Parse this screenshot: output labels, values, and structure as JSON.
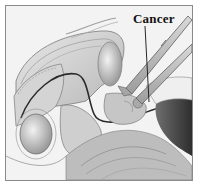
{
  "illustration": {
    "subject": "anatomical cross-section with surgical instruments",
    "style": "grayscale pencil rendering",
    "border_color": "#8a8a8a",
    "annotation": {
      "label": "Cancer",
      "pointer": "leader-line"
    }
  }
}
